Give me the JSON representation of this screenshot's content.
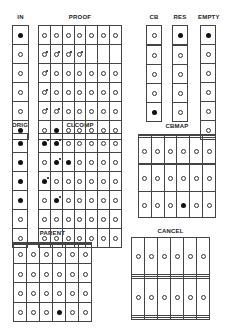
{
  "legend": {
    "o": "open-circle",
    "f": "filled-dot",
    "g": "open-circle-marked",
    "G": "filled-dot-marked",
    "": "empty"
  },
  "panels": {
    "in": {
      "label": "IN",
      "rows": [
        [
          "f"
        ],
        [
          "o"
        ],
        [
          "o"
        ],
        [
          "o"
        ],
        [
          "o"
        ],
        [
          "f"
        ]
      ]
    },
    "proof": {
      "label": "PROOF",
      "rows": [
        [
          "o",
          "o",
          "o",
          "o",
          "o",
          "o",
          "o"
        ],
        [
          "g",
          "g",
          "g",
          "g",
          "",
          "",
          ""
        ],
        [
          "g",
          "o",
          "o",
          "o",
          "o",
          "o",
          "o"
        ],
        [
          "g",
          "o",
          "o",
          "o",
          "o",
          "o",
          "o"
        ],
        [
          "g",
          "g",
          "o",
          "o",
          "o",
          "o",
          "o"
        ],
        [
          "o",
          "f",
          "o",
          "o",
          "o",
          "o",
          "o"
        ]
      ]
    },
    "cb": {
      "label": "CB",
      "rows": [
        [
          "o"
        ],
        [
          ""
        ],
        [
          "o"
        ],
        [
          "o"
        ],
        [
          "o"
        ],
        [
          "f"
        ]
      ]
    },
    "res": {
      "label": "RES",
      "rows": [
        [
          "f"
        ],
        [
          ""
        ],
        [
          "o"
        ],
        [
          "o"
        ],
        [
          "o"
        ],
        [
          "o"
        ]
      ]
    },
    "empty": {
      "label": "EMPTY",
      "rows": [
        [
          "f"
        ],
        [
          "o"
        ],
        [
          "o"
        ],
        [
          "o"
        ],
        [
          "o"
        ],
        [
          "o"
        ]
      ]
    },
    "orig": {
      "label": "ORIG",
      "rows": [
        [
          "f"
        ],
        [
          "f"
        ],
        [
          "f"
        ],
        [
          "f"
        ],
        [
          "o"
        ],
        [
          "o"
        ]
      ]
    },
    "clcomp": {
      "label": "CLCOMP",
      "rows": [
        [
          "G",
          "G",
          "o",
          "o",
          "o",
          "o",
          "o"
        ],
        [
          "o",
          "G",
          "f",
          "o",
          "o",
          "o",
          "o"
        ],
        [
          "G",
          "o",
          "o",
          "o",
          "o",
          "o",
          "o"
        ],
        [
          "o",
          "G",
          "o",
          "o",
          "o",
          "o",
          "o"
        ],
        [
          "o",
          "o",
          "o",
          "o",
          "o",
          "o",
          "o"
        ],
        [
          "o",
          "o",
          "o",
          "o",
          "o",
          "o",
          "o"
        ]
      ]
    },
    "cbmap": {
      "label": "CBMAP",
      "rows": [
        [
          "",
          "",
          "",
          "",
          "",
          ""
        ],
        [
          "",
          "",
          "",
          "",
          "",
          ""
        ],
        [
          "o",
          "o",
          "o",
          "o",
          "o",
          "o"
        ],
        [
          "",
          "",
          "",
          "",
          "",
          ""
        ],
        [
          "o",
          "o",
          "o",
          "o",
          "o",
          "o"
        ],
        [
          "o",
          "o",
          "o",
          "f",
          "o",
          "o"
        ]
      ]
    },
    "parent": {
      "label": "PARENT",
      "rows": [
        [
          "",
          "",
          "",
          "",
          "",
          ""
        ],
        [
          "",
          "",
          "",
          "",
          "",
          ""
        ],
        [
          "o",
          "o",
          "o",
          "o",
          "o",
          "o"
        ],
        [
          "o",
          "o",
          "o",
          "o",
          "o",
          "o"
        ],
        [
          "o",
          "o",
          "o",
          "o",
          "o",
          "o"
        ],
        [
          "o",
          "o",
          "o",
          "f",
          "o",
          "o"
        ]
      ]
    },
    "cancel": {
      "label": "CANCEL",
      "rows": [
        [
          "o",
          "o",
          "o",
          "o",
          "o",
          "o"
        ],
        [
          "",
          "",
          "",
          "",
          "",
          ""
        ],
        [
          "",
          "",
          "",
          "",
          "",
          ""
        ],
        [
          "o",
          "o",
          "o",
          "o",
          "o",
          "o"
        ],
        [
          "",
          "",
          "",
          "",
          "",
          ""
        ],
        [
          "",
          "",
          "",
          "",
          "",
          ""
        ]
      ]
    }
  }
}
